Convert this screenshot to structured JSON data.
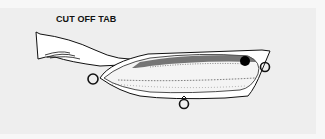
{
  "figure": {
    "label": "CUT OFF TAB",
    "parts": [
      {
        "name": "tab",
        "description": "tail tab extending from rear of lure"
      },
      {
        "name": "body",
        "description": "lure body with speckled shading"
      },
      {
        "name": "eye",
        "description": "dark eye near nose"
      },
      {
        "name": "rear-eyelet"
      },
      {
        "name": "nose-eyelet"
      },
      {
        "name": "belly-eyelet"
      }
    ]
  },
  "colors": {
    "background": "#f7f7f7",
    "panel": "#eeeeee",
    "ink": "#111111"
  }
}
